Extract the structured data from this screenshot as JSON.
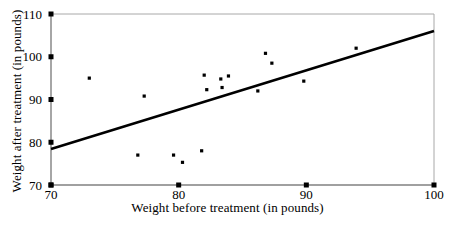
{
  "chart_data": {
    "type": "scatter",
    "title": "",
    "xlabel": "Weight before treatment (in pounds)",
    "ylabel": "Weight after treatment (in pounds)",
    "xlim": [
      70,
      100
    ],
    "ylim": [
      70,
      110
    ],
    "xticks": [
      70,
      80,
      90,
      100
    ],
    "yticks": [
      70,
      80,
      90,
      100,
      110
    ],
    "xtick_labels": [
      "70",
      "80",
      "90",
      "100"
    ],
    "ytick_labels": [
      "70",
      "80",
      "90",
      "100",
      "110"
    ],
    "grid": false,
    "legend": null,
    "marker_color": "#000000",
    "line_color": "#000000",
    "axis_color": "#808080",
    "points": [
      {
        "x": 73.0,
        "y": 95.0
      },
      {
        "x": 76.8,
        "y": 77.0
      },
      {
        "x": 77.3,
        "y": 90.8
      },
      {
        "x": 79.6,
        "y": 77.0
      },
      {
        "x": 80.3,
        "y": 75.3
      },
      {
        "x": 81.8,
        "y": 78.0
      },
      {
        "x": 82.0,
        "y": 95.7
      },
      {
        "x": 82.2,
        "y": 92.3
      },
      {
        "x": 83.3,
        "y": 94.8
      },
      {
        "x": 83.4,
        "y": 92.8
      },
      {
        "x": 83.9,
        "y": 95.5
      },
      {
        "x": 86.2,
        "y": 92.0
      },
      {
        "x": 86.8,
        "y": 100.8
      },
      {
        "x": 87.3,
        "y": 98.5
      },
      {
        "x": 89.8,
        "y": 94.3
      },
      {
        "x": 93.9,
        "y": 102.0
      }
    ],
    "trendline": {
      "name": "regression-line",
      "x_start": 70,
      "y_start": 78.4,
      "x_end": 100,
      "y_end": 106.0
    }
  }
}
